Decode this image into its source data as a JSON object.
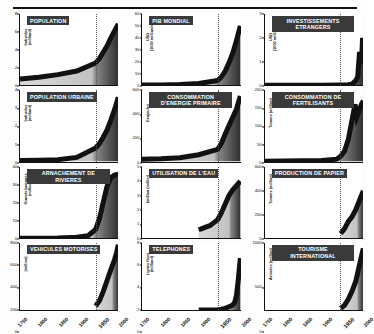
{
  "figure": {
    "name": "great-acceleration-socio-economic-trends",
    "background_color": "#fdfdfd",
    "title_box_color": "#3a3a3a",
    "title_text_color": "#ffffff",
    "axis_color": "#111111",
    "divider_color": "#555555",
    "fill_light": "#d9d9d9",
    "fill_dark": "#2f2f2f"
  },
  "xaxis": {
    "ticks": [
      "1750",
      "1800",
      "1850",
      "1900",
      "1950",
      "2000"
    ],
    "emphasized_tick": "1950",
    "range": [
      1750,
      2010
    ],
    "divider_year": 1950
  },
  "chart_data": [
    {
      "type": "area",
      "title": "POPULATION",
      "ylabel": "Individus\n(milliard)",
      "ylabel_lines": [
        "Individus",
        "(milliard)"
      ],
      "yticks": [
        0,
        2,
        4,
        6,
        8
      ],
      "ylim": [
        0,
        8
      ],
      "xlabel": "",
      "xlim": [
        1750,
        2010
      ],
      "x": [
        1750,
        1800,
        1850,
        1900,
        1950,
        1960,
        1970,
        1980,
        1990,
        2000,
        2010
      ],
      "values": [
        0.7,
        0.9,
        1.2,
        1.6,
        2.5,
        3.0,
        3.7,
        4.4,
        5.3,
        6.1,
        6.9
      ]
    },
    {
      "type": "area",
      "title": "PIB MONDIAL",
      "ylabel": "USD\n(1000 milliards)",
      "ylabel_lines": [
        "USD",
        "(1000 milliards)"
      ],
      "yticks": [
        0,
        10,
        20,
        30,
        40,
        50,
        60
      ],
      "ylim": [
        0,
        60
      ],
      "xlabel": "",
      "xlim": [
        1750,
        2010
      ],
      "x": [
        1750,
        1800,
        1850,
        1900,
        1950,
        1960,
        1970,
        1980,
        1990,
        2000,
        2010
      ],
      "values": [
        0.2,
        0.3,
        0.6,
        1.5,
        4.0,
        7.0,
        12.0,
        19.0,
        27.0,
        38.0,
        50.0
      ]
    },
    {
      "type": "area",
      "title": "INVESTISSEMENTS ETRANGERS",
      "ylabel": "USD\n(1000 milliards)",
      "ylabel_lines": [
        "USD",
        "(1000 milliards)"
      ],
      "yticks": [
        0,
        1,
        2,
        3
      ],
      "ylim": [
        0,
        3
      ],
      "xlabel": "",
      "xlim": [
        1750,
        2010
      ],
      "x": [
        1750,
        1900,
        1950,
        1970,
        1980,
        1990,
        1995,
        2000,
        2005,
        2008,
        2010
      ],
      "values": [
        0.0,
        0.0,
        0.01,
        0.02,
        0.05,
        0.2,
        0.35,
        1.4,
        0.9,
        2.0,
        1.3
      ]
    },
    {
      "type": "area",
      "title": "POPULATION URBAINE",
      "ylabel": "Individus\n(milliard)",
      "ylabel_lines": [
        "Individus",
        "(milliard)"
      ],
      "yticks": [
        0,
        1,
        2,
        3,
        4
      ],
      "ylim": [
        0,
        4
      ],
      "xlabel": "",
      "xlim": [
        1750,
        2010
      ],
      "x": [
        1750,
        1800,
        1850,
        1900,
        1950,
        1960,
        1970,
        1980,
        1990,
        2000,
        2010
      ],
      "values": [
        0.05,
        0.06,
        0.09,
        0.22,
        0.75,
        1.0,
        1.35,
        1.75,
        2.3,
        2.9,
        3.6
      ]
    },
    {
      "type": "area",
      "title": "CONSOMMATION D'ENERGIE PRIMAIRE",
      "ylabel": "Exajoules",
      "ylabel_lines": [
        "Exajoules"
      ],
      "yticks": [
        0,
        200,
        400,
        600
      ],
      "ylim": [
        0,
        600
      ],
      "xlabel": "",
      "xlim": [
        1750,
        2010
      ],
      "x": [
        1750,
        1800,
        1850,
        1900,
        1950,
        1960,
        1970,
        1980,
        1990,
        2000,
        2010
      ],
      "values": [
        18,
        22,
        30,
        55,
        100,
        150,
        230,
        300,
        370,
        440,
        550
      ]
    },
    {
      "type": "area",
      "title": "CONSOMMATION DE FERTILISANTS",
      "ylabel": "Tonnes (million)",
      "ylabel_lines": [
        "Tonnes (million)"
      ],
      "yticks": [
        0,
        50,
        100,
        150,
        200
      ],
      "ylim": [
        0,
        200
      ],
      "xlabel": "",
      "xlim": [
        1750,
        2010
      ],
      "x": [
        1750,
        1900,
        1940,
        1950,
        1960,
        1970,
        1980,
        1988,
        1993,
        2000,
        2005,
        2010
      ],
      "values": [
        0,
        2,
        6,
        14,
        28,
        60,
        115,
        160,
        125,
        145,
        160,
        170
      ]
    },
    {
      "type": "area",
      "title": "ARNACHEMENT DE RIVIERES",
      "ylabel": "Grands barrages\n(millier)",
      "ylabel_lines": [
        "Grands barrages",
        "(millier)"
      ],
      "yticks": [
        0,
        10,
        20,
        30,
        40
      ],
      "ylim": [
        0,
        40
      ],
      "xlabel": "",
      "xlim": [
        1750,
        2010
      ],
      "x": [
        1750,
        1850,
        1900,
        1930,
        1950,
        1960,
        1970,
        1980,
        1990,
        2000,
        2010
      ],
      "values": [
        0,
        0.2,
        0.6,
        1.5,
        5,
        11,
        20,
        29,
        34,
        35.5,
        36
      ]
    },
    {
      "type": "area",
      "title": "UTILISATION DE L'EAU",
      "ylabel": "km3/an (millier)",
      "ylabel_lines": [
        "km3/an (millier)"
      ],
      "yticks": [
        0,
        1,
        2,
        3,
        4,
        5
      ],
      "ylim": [
        0,
        5
      ],
      "xlabel": "",
      "xlim": [
        1750,
        2010
      ],
      "x": [
        1900,
        1910,
        1920,
        1930,
        1940,
        1950,
        1960,
        1970,
        1980,
        1990,
        2000,
        2010
      ],
      "values": [
        0.6,
        0.7,
        0.8,
        0.9,
        1.1,
        1.3,
        1.8,
        2.4,
        3.0,
        3.4,
        3.7,
        4.0
      ]
    },
    {
      "type": "area",
      "title": "PRODUCTION DE PAPIER",
      "ylabel": "Tonnes (million)",
      "ylabel_lines": [
        "Tonnes (million)"
      ],
      "yticks": [
        0,
        200,
        400,
        600
      ],
      "ylim": [
        0,
        600
      ],
      "xlabel": "",
      "xlim": [
        1750,
        2010
      ],
      "x": [
        1950,
        1960,
        1970,
        1980,
        1990,
        2000,
        2005,
        2010
      ],
      "values": [
        40,
        80,
        140,
        180,
        240,
        320,
        360,
        400
      ]
    },
    {
      "type": "area",
      "title": "VEHICULES MOTORISES",
      "ylabel": "(million)",
      "ylabel_lines": [
        "(million)"
      ],
      "yticks": [
        0,
        200,
        400,
        600,
        800
      ],
      "ylim": [
        0,
        800
      ],
      "xlabel": "",
      "xlim": [
        1750,
        2010
      ],
      "x": [
        1950,
        1960,
        1970,
        1980,
        1990,
        2000,
        2005,
        2010
      ],
      "values": [
        50,
        110,
        220,
        350,
        480,
        600,
        680,
        780
      ]
    },
    {
      "type": "area",
      "title": "TELEPHONES",
      "ylabel": "Lignes fixes\n(milliard)",
      "ylabel_lines": [
        "Lignes fixes",
        "(milliard)"
      ],
      "yticks": [
        0,
        2,
        4,
        6,
        8
      ],
      "ylim": [
        0,
        8
      ],
      "xlabel": "",
      "xlim": [
        1750,
        2010
      ],
      "x": [
        1900,
        1950,
        1960,
        1970,
        1980,
        1990,
        1995,
        2000,
        2005,
        2010
      ],
      "values": [
        0.0,
        0.05,
        0.1,
        0.2,
        0.4,
        0.6,
        0.9,
        1.8,
        3.8,
        6.2
      ]
    },
    {
      "type": "area",
      "title": "TOURISME INTERNATIONAL",
      "ylabel": "Arrivées (million)",
      "ylabel_lines": [
        "Arrivées (million)"
      ],
      "yticks": [
        0,
        500,
        1000
      ],
      "ylim": [
        0,
        1000
      ],
      "xlabel": "",
      "xlim": [
        1750,
        2010
      ],
      "x": [
        1950,
        1960,
        1970,
        1980,
        1990,
        2000,
        2005,
        2010
      ],
      "values": [
        25,
        70,
        160,
        280,
        430,
        680,
        800,
        920
      ]
    }
  ]
}
